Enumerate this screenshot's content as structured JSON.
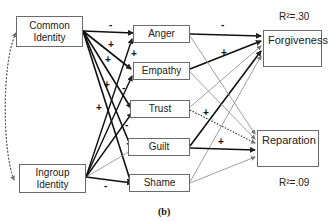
{
  "nodes": {
    "common_identity": "Common Identity",
    "ingroup_identity": "Ingroup Identity",
    "anger": "Anger",
    "empathy": "Empathy",
    "trust": "Trust",
    "guilt": "Guilt",
    "shame": "Shame",
    "forgiveness": "Forgiveness",
    "reparation": "Reparation"
  },
  "r_squared": {
    "forgiveness": "R²=.30",
    "reparation": "R²=.09"
  },
  "signs": {
    "ci_anger": "-",
    "ci_empathy": "+",
    "ci_trust": "+",
    "ci_guilt": "+",
    "ci_shame": "+",
    "ig_empathy": "+",
    "ig_trust": "-",
    "ig_guilt": "-",
    "ig_shame": "-",
    "anger_forgiveness": "-",
    "empathy_forgiveness": "+",
    "trust_reparation": "+",
    "guilt_reparation": "+"
  },
  "caption": "(b)"
}
